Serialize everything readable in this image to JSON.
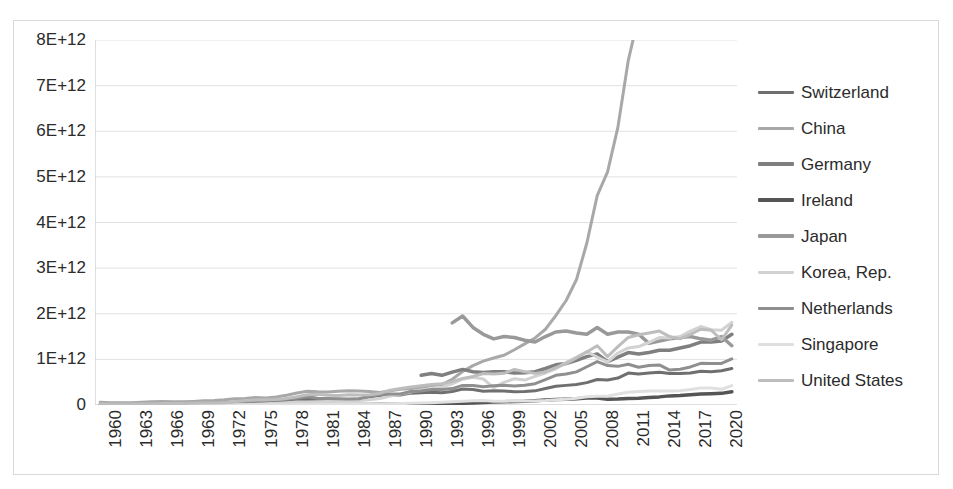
{
  "chart_data": {
    "type": "line",
    "title": "",
    "xlabel": "",
    "ylabel": "",
    "ylim": [
      0,
      8000000000000
    ],
    "xlim": [
      1960,
      2022
    ],
    "grid": true,
    "legend_position": "right",
    "y_tick_labels": [
      "8E+12",
      "7E+12",
      "6E+12",
      "5E+12",
      "4E+12",
      "3E+12",
      "2E+12",
      "1E+12",
      "0"
    ],
    "y_tick_values": [
      8000000000000,
      7000000000000,
      6000000000000,
      5000000000000,
      4000000000000,
      3000000000000,
      2000000000000,
      1000000000000,
      0
    ],
    "x_tick_labels": [
      "1960",
      "1963",
      "1966",
      "1969",
      "1972",
      "1975",
      "1978",
      "1981",
      "1984",
      "1987",
      "1990",
      "1993",
      "1996",
      "1999",
      "2002",
      "2005",
      "2008",
      "2011",
      "2014",
      "2017",
      "2020"
    ],
    "x_tick_values": [
      1960,
      1963,
      1966,
      1969,
      1972,
      1975,
      1978,
      1981,
      1984,
      1987,
      1990,
      1993,
      1996,
      1999,
      2002,
      2005,
      2008,
      2011,
      2014,
      2017,
      2020
    ],
    "x_all_years": [
      1960,
      1961,
      1962,
      1963,
      1964,
      1965,
      1966,
      1967,
      1968,
      1969,
      1970,
      1971,
      1972,
      1973,
      1974,
      1975,
      1976,
      1977,
      1978,
      1979,
      1980,
      1981,
      1982,
      1983,
      1984,
      1985,
      1986,
      1987,
      1988,
      1989,
      1990,
      1991,
      1992,
      1993,
      1994,
      1995,
      1996,
      1997,
      1998,
      1999,
      2000,
      2001,
      2002,
      2003,
      2004,
      2005,
      2006,
      2007,
      2008,
      2009,
      2010,
      2011,
      2012,
      2013,
      2014,
      2015,
      2016,
      2017,
      2018,
      2019,
      2020,
      2021
    ],
    "series": [
      {
        "name": "Switzerland",
        "color": "#6f6f6f",
        "width": 3,
        "start_year": 1960,
        "values": [
          9000000000.0,
          10000000000.0,
          11000000000.0,
          12000000000.0,
          13000000000.0,
          14000000000.0,
          15000000000.0,
          16000000000.0,
          18000000000.0,
          20000000000.0,
          22000000000.0,
          26000000000.0,
          32000000000.0,
          42000000000.0,
          50000000000.0,
          58000000000.0,
          62000000000.0,
          66000000000.0,
          85000000000.0,
          106000000000.0,
          125000000000.0,
          118000000000.0,
          120000000000.0,
          122000000000.0,
          122000000000.0,
          130000000000.0,
          180000000000.0,
          210000000000.0,
          225000000000.0,
          220000000000.0,
          260000000000.0,
          270000000000.0,
          280000000000.0,
          270000000000.0,
          295000000000.0,
          350000000000.0,
          340000000000.0,
          300000000000.0,
          310000000000.0,
          305000000000.0,
          290000000000.0,
          295000000000.0,
          310000000000.0,
          360000000000.0,
          410000000000.0,
          430000000000.0,
          450000000000.0,
          490000000000.0,
          560000000000.0,
          550000000000.0,
          590000000000.0,
          700000000000.0,
          680000000000.0,
          700000000000.0,
          720000000000.0,
          690000000000.0,
          690000000000.0,
          700000000000.0,
          740000000000.0,
          730000000000.0,
          750000000000.0,
          800000000000.0
        ]
      },
      {
        "name": "China",
        "color": "#a8a8a8",
        "width": 3,
        "start_year": 1960,
        "values": [
          60000000000.0,
          50000000000.0,
          47000000000.0,
          50000000000.0,
          59000000000.0,
          70000000000.0,
          76000000000.0,
          72000000000.0,
          70000000000.0,
          79000000000.0,
          92000000000.0,
          99000000000.0,
          113000000000.0,
          138000000000.0,
          144000000000.0,
          163000000000.0,
          152000000000.0,
          174000000000.0,
          215000000000.0,
          263000000000.0,
          303000000000.0,
          289000000000.0,
          284000000000.0,
          302000000000.0,
          310000000000.0,
          309000000000.0,
          298000000000.0,
          272000000000.0,
          310000000000.0,
          345000000000.0,
          361000000000.0,
          383000000000.0,
          427000000000.0,
          445000000000.0,
          564000000000.0,
          735000000000.0,
          864000000000.0,
          962000000000.0,
          1030000000000.0,
          1090000000000.0,
          1210000000000.0,
          1340000000000.0,
          1470000000000.0,
          1660000000000.0,
          1960000000000.0,
          2290000000000.0,
          2750000000000.0,
          3550000000000.0,
          4590000000000.0,
          5110000000000.0,
          6090000000000.0,
          7550000000000.0,
          8530000000000.0,
          9570000000000.0,
          10470000000000.0,
          11060000000000.0,
          11140000000000.0,
          12280000000000.0,
          13890000000000.0,
          14280000000000.0,
          14680000000000.0,
          17820000000000.0
        ]
      },
      {
        "name": "Germany",
        "color": "#7f7f7f",
        "width": 3.5,
        "start_year": 1991,
        "values": [
          650000000000.0,
          690000000000.0,
          650000000000.0,
          720000000000.0,
          780000000000.0,
          730000000000.0,
          710000000000.0,
          730000000000.0,
          730000000000.0,
          700000000000.0,
          705000000000.0,
          730000000000.0,
          800000000000.0,
          880000000000.0,
          910000000000.0,
          980000000000.0,
          1060000000000.0,
          1120000000000.0,
          950000000000.0,
          1050000000000.0,
          1150000000000.0,
          1120000000000.0,
          1150000000000.0,
          1200000000000.0,
          1200000000000.0,
          1250000000000.0,
          1300000000000.0,
          1380000000000.0,
          1380000000000.0,
          1400000000000.0,
          1550000000000.0,
          1150000000000.0
        ]
      },
      {
        "name": "Ireland",
        "color": "#555555",
        "width": 3.5,
        "start_year": 1960,
        "values": [
          500000000.0,
          500000000.0,
          600000000.0,
          600000000.0,
          700000000.0,
          800000000.0,
          800000000.0,
          900000000.0,
          1000000000.0,
          1100000000.0,
          1300000000.0,
          1500000000.0,
          1800000000.0,
          2200000000.0,
          2700000000.0,
          3100000000.0,
          3600000000.0,
          4600000000.0,
          5600000000.0,
          6400000000.0,
          7700000000.0,
          7900000000.0,
          8400000000.0,
          9000000000.0,
          10400000000.0,
          10900000000.0,
          12200000000.0,
          14600000000.0,
          17400000000.0,
          19500000000.0,
          24200000000.0,
          25200000000.0,
          28500000000.0,
          28500000000.0,
          33200000000.0,
          40500000000.0,
          44900000000.0,
          53200000000.0,
          64800000000.0,
          71700000000.0,
          77000000000.0,
          83000000000.0,
          95000000000.0,
          108000000000.0,
          118000000000.0,
          125000000000.0,
          135000000000.0,
          153000000000.0,
          155000000000.0,
          126000000000.0,
          130000000000.0,
          145000000000.0,
          150000000000.0,
          162000000000.0,
          178000000000.0,
          200000000000.0,
          210000000000.0,
          225000000000.0,
          240000000000.0,
          245000000000.0,
          255000000000.0,
          290000000000.0
        ]
      },
      {
        "name": "Japan",
        "color": "#999999",
        "width": 3.5,
        "start_year": 1994,
        "values": [
          1800000000000.0,
          1950000000000.0,
          1700000000000.0,
          1550000000000.0,
          1450000000000.0,
          1500000000000.0,
          1480000000000.0,
          1420000000000.0,
          1380000000000.0,
          1500000000000.0,
          1600000000000.0,
          1620000000000.0,
          1580000000000.0,
          1550000000000.0,
          1700000000000.0,
          1550000000000.0,
          1600000000000.0,
          1600000000000.0,
          1550000000000.0,
          1350000000000.0,
          1400000000000.0,
          1450000000000.0,
          1480000000000.0,
          1500000000000.0,
          1450000000000.0,
          1420000000000.0,
          1500000000000.0,
          1300000000000.0
        ]
      },
      {
        "name": "Korea, Rep.",
        "color": "#d2d2d2",
        "width": 3,
        "start_year": 1960,
        "values": [
          2000000000.0,
          2000000000.0,
          3000000000.0,
          3000000000.0,
          3000000000.0,
          3000000000.0,
          4000000000.0,
          5000000000.0,
          6000000000.0,
          7000000000.0,
          9000000000.0,
          10000000000.0,
          11000000000.0,
          14000000000.0,
          19000000000.0,
          22000000000.0,
          30000000000.0,
          37000000000.0,
          52000000000.0,
          65000000000.0,
          65000000000.0,
          72000000000.0,
          78000000000.0,
          87000000000.0,
          95000000000.0,
          100000000000.0,
          115000000000.0,
          143000000000.0,
          197000000000.0,
          236000000000.0,
          283000000000.0,
          330000000000.0,
          356000000000.0,
          392000000000.0,
          463000000000.0,
          566000000000.0,
          610000000000.0,
          570000000000.0,
          380000000000.0,
          497000000000.0,
          576000000000.0,
          547000000000.0,
          627000000000.0,
          702000000000.0,
          793000000000.0,
          934000000000.0,
          1050000000000.0,
          1170000000000.0,
          1050000000000.0,
          944000000000.0,
          1140000000000.0,
          1250000000000.0,
          1280000000000.0,
          1370000000000.0,
          1480000000000.0,
          1470000000000.0,
          1500000000000.0,
          1620000000000.0,
          1720000000000.0,
          1650000000000.0,
          1640000000000.0,
          1810000000000.0
        ]
      },
      {
        "name": "Netherlands",
        "color": "#8f8f8f",
        "width": 3,
        "start_year": 1960,
        "values": [
          12000000000.0,
          13000000000.0,
          14000000000.0,
          15000000000.0,
          17000000000.0,
          19000000000.0,
          21000000000.0,
          23000000000.0,
          25000000000.0,
          28000000000.0,
          35000000000.0,
          40000000000.0,
          48000000000.0,
          62000000000.0,
          73000000000.0,
          86000000000.0,
          96000000000.0,
          107000000000.0,
          126000000000.0,
          147000000000.0,
          179000000000.0,
          146000000000.0,
          141000000000.0,
          138000000000.0,
          132000000000.0,
          138000000000.0,
          193000000000.0,
          226000000000.0,
          239000000000.0,
          241000000000.0,
          298000000000.0,
          307000000000.0,
          342000000000.0,
          338000000000.0,
          360000000000.0,
          430000000000.0,
          427000000000.0,
          400000000000.0,
          424000000000.0,
          432000000000.0,
          416000000000.0,
          433000000000.0,
          468000000000.0,
          557000000000.0,
          650000000000.0,
          678000000000.0,
          726000000000.0,
          839000000000.0,
          951000000000.0,
          865000000000.0,
          847000000000.0,
          894000000000.0,
          828000000000.0,
          866000000000.0,
          879000000000.0,
          765000000000.0,
          783000000000.0,
          834000000000.0,
          914000000000.0,
          910000000000.0,
          910000000000.0,
          1010000000000.0
        ]
      },
      {
        "name": "Singapore",
        "color": "#e0e0e0",
        "width": 3,
        "start_year": 1960,
        "values": [
          700000000.0,
          800000000.0,
          900000000.0,
          1000000000.0,
          900000000.0,
          1000000000.0,
          1100000000.0,
          1300000000.0,
          1500000000.0,
          1800000000.0,
          2200000000.0,
          2600000000.0,
          3300000000.0,
          4400000000.0,
          5600000000.0,
          5900000000.0,
          6300000000.0,
          6900000000.0,
          8200000000.0,
          9900000000.0,
          11800000000.0,
          13600000000.0,
          14400000000.0,
          15200000000.0,
          16400000000.0,
          17200000000.0,
          17900000000.0,
          21300000000.0,
          26700000000.0,
          30700000000.0,
          36200000000.0,
          41200000000.0,
          49800000000.0,
          59900000000.0,
          73600000000.0,
          84000000000.0,
          94000000000.0,
          97000000000.0,
          82000000000.0,
          84000000000.0,
          94000000000.0,
          86000000000.0,
          90000000000.0,
          97000000000.0,
          115000000000.0,
          127000000000.0,
          147000000000.0,
          180000000000.0,
          193000000000.0,
          194000000000.0,
          240000000000.0,
          280000000000.0,
          295000000000.0,
          305000000000.0,
          308000000000.0,
          305000000000.0,
          310000000000.0,
          339000000000.0,
          374000000000.0,
          375000000000.0,
          345000000000.0,
          424000000000.0
        ]
      },
      {
        "name": "United States",
        "color": "#bdbdbd",
        "width": 3,
        "start_year": 1960,
        "values": [
          21000000000.0,
          21000000000.0,
          22000000000.0,
          24000000000.0,
          27000000000.0,
          28000000000.0,
          31000000000.0,
          32000000000.0,
          35000000000.0,
          38000000000.0,
          43000000000.0,
          44000000000.0,
          49000000000.0,
          71000000000.0,
          98000000000.0,
          108000000000.0,
          115000000000.0,
          121000000000.0,
          144000000000.0,
          182000000000.0,
          225000000000.0,
          238000000000.0,
          216000000000.0,
          206000000000.0,
          224000000000.0,
          219000000000.0,
          227000000000.0,
          254000000000.0,
          322000000000.0,
          363000000000.0,
          393000000000.0,
          421000000000.0,
          448000000000.0,
          465000000000.0,
          512000000000.0,
          584000000000.0,
          625000000000.0,
          689000000000.0,
          682000000000.0,
          695000000000.0,
          781000000000.0,
          729000000000.0,
          693000000000.0,
          724000000000.0,
          818000000000.0,
          907000000000.0,
          1030000000000.0,
          1160000000000.0,
          1300000000000.0,
          1060000000000.0,
          1280000000000.0,
          1480000000000.0,
          1540000000000.0,
          1580000000000.0,
          1620000000000.0,
          1500000000000.0,
          1450000000000.0,
          1550000000000.0,
          1660000000000.0,
          1640000000000.0,
          1430000000000.0,
          1750000000000.0
        ]
      }
    ]
  },
  "legend": {
    "items": [
      {
        "label": "Switzerland"
      },
      {
        "label": "China"
      },
      {
        "label": "Germany"
      },
      {
        "label": "Ireland"
      },
      {
        "label": "Japan"
      },
      {
        "label": "Korea, Rep."
      },
      {
        "label": "Netherlands"
      },
      {
        "label": "Singapore"
      },
      {
        "label": "United States"
      }
    ]
  }
}
